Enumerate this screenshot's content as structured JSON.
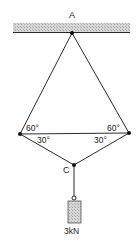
{
  "diagram": {
    "type": "statics-truss",
    "colors": {
      "line": "#2a2a2a",
      "ceiling_fill": "#cfcfcf",
      "weight_fill": "#c8c8c8"
    },
    "labels": {
      "support": "A",
      "bottom_node": "C",
      "angle_left_top": "60°",
      "angle_left_bottom": "30°",
      "angle_right_top": "60°",
      "angle_right_bottom": "30°",
      "load": "3kN"
    },
    "nodes": {
      "A": [
        72,
        33
      ],
      "left": [
        20,
        134
      ],
      "right": [
        129,
        133
      ],
      "C": [
        74,
        165
      ]
    }
  }
}
